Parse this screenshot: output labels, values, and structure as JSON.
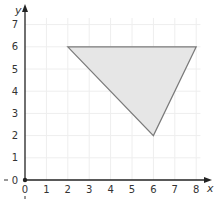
{
  "chart_data": {
    "type": "scatter",
    "title": "",
    "xlabel": "x",
    "ylabel": "y",
    "xlim": [
      0,
      8
    ],
    "ylim": [
      0,
      7
    ],
    "x_ticks": [
      "0",
      "1",
      "2",
      "3",
      "4",
      "5",
      "6",
      "7",
      "8"
    ],
    "y_ticks": [
      "0",
      "1",
      "2",
      "3",
      "4",
      "5",
      "6",
      "7"
    ],
    "grid": true,
    "legend": null,
    "shapes": [
      {
        "type": "polygon",
        "name": "triangle",
        "vertices": [
          [
            2,
            6
          ],
          [
            8,
            6
          ],
          [
            6,
            2
          ]
        ],
        "fill": "#e6e6e6",
        "stroke": "#7a7a7a"
      }
    ]
  },
  "colors": {
    "axis": "#222222",
    "grid": "#eeeeee",
    "fill": "#e6e6e6",
    "stroke": "#7a7a7a"
  }
}
